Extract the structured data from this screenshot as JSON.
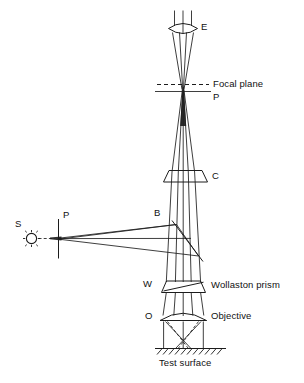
{
  "figure": {
    "type": "optical-ray-diagram",
    "background_color": "#ffffff",
    "line_color": "#1c1c1c"
  },
  "labels": {
    "eyepiece": "E",
    "focal_plane": "Focal plane",
    "focal_point": "P",
    "compensator": "C",
    "beam_splitter": "B",
    "source": "S",
    "polarizer": "P",
    "wollaston_short": "W",
    "wollaston_full": "Wollaston prism",
    "objective_short": "O",
    "objective_full": "Objective",
    "test_surface": "Test surface"
  },
  "components": [
    {
      "id": "eyepiece",
      "symbol": "E",
      "name": "Eyepiece",
      "shape": "biconvex-lens"
    },
    {
      "id": "focal-plane",
      "symbol": "P",
      "name": "Focal plane",
      "shape": "dashed-line"
    },
    {
      "id": "compensator",
      "symbol": "C",
      "name": "Compensator",
      "shape": "parallelogram"
    },
    {
      "id": "beam-splitter",
      "symbol": "B",
      "name": "Beam splitter",
      "shape": "diagonal-line"
    },
    {
      "id": "polarizer",
      "symbol": "P",
      "name": "Polarizer",
      "shape": "vertical-line"
    },
    {
      "id": "source",
      "symbol": "S",
      "name": "Light source",
      "shape": "sun-starburst"
    },
    {
      "id": "wollaston",
      "symbol": "W",
      "name": "Wollaston prism",
      "shape": "trapezoid"
    },
    {
      "id": "objective",
      "symbol": "O",
      "name": "Objective",
      "shape": "plano-convex-lens"
    },
    {
      "id": "test-surface",
      "symbol": "",
      "name": "Test surface",
      "shape": "hatched-line"
    }
  ],
  "caption": {
    "partial_text": ""
  }
}
